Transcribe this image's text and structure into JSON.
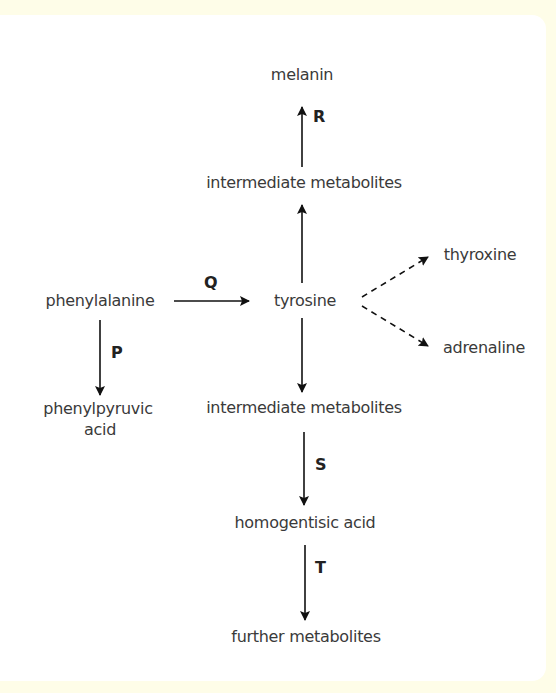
{
  "diagram": {
    "nodes": {
      "melanin": "melanin",
      "intermediate_top": "intermediate metabolites",
      "phenylalanine": "phenylalanine",
      "tyrosine": "tyrosine",
      "thyroxine": "thyroxine",
      "adrenaline": "adrenaline",
      "phenylpyruvic_1": "phenylpyruvic",
      "phenylpyruvic_2": "acid",
      "intermediate_bottom": "intermediate metabolites",
      "homogentisic": "homogentisic acid",
      "further": "further metabolites"
    },
    "enzymes": {
      "P": "P",
      "Q": "Q",
      "R": "R",
      "S": "S",
      "T": "T"
    },
    "edges": [
      {
        "from": "phenylalanine",
        "to": "phenylpyruvic acid",
        "label": "P",
        "style": "solid"
      },
      {
        "from": "phenylalanine",
        "to": "tyrosine",
        "label": "Q",
        "style": "solid"
      },
      {
        "from": "tyrosine",
        "to": "intermediate metabolites (top)",
        "label": "",
        "style": "solid"
      },
      {
        "from": "intermediate metabolites (top)",
        "to": "melanin",
        "label": "R",
        "style": "solid"
      },
      {
        "from": "tyrosine",
        "to": "thyroxine",
        "label": "",
        "style": "dashed"
      },
      {
        "from": "tyrosine",
        "to": "adrenaline",
        "label": "",
        "style": "dashed"
      },
      {
        "from": "tyrosine",
        "to": "intermediate metabolites (bottom)",
        "label": "",
        "style": "solid"
      },
      {
        "from": "intermediate metabolites (bottom)",
        "to": "homogentisic acid",
        "label": "S",
        "style": "solid"
      },
      {
        "from": "homogentisic acid",
        "to": "further metabolites",
        "label": "T",
        "style": "solid"
      }
    ],
    "colors": {
      "background": "#fefde8",
      "panel": "#ffffff",
      "text": "#3a3a3a",
      "arrow": "#111111"
    }
  }
}
